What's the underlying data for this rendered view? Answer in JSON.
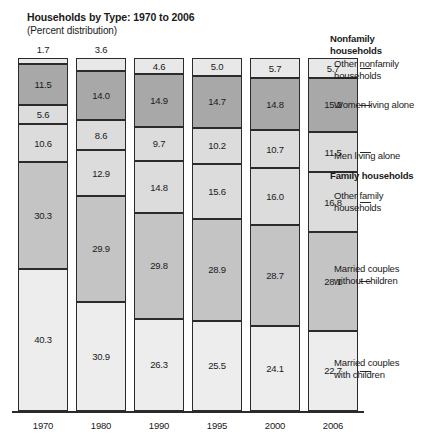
{
  "chart_data": {
    "type": "bar",
    "title": "Households by Type: 1970 to 2006",
    "subtitle": "(Percent distribution)",
    "xlabel": "",
    "ylabel": "",
    "ylim": [
      0,
      100
    ],
    "grid": false,
    "stacked": true,
    "legend_position": "right",
    "categories": [
      "1970",
      "1980",
      "1990",
      "1995",
      "2000",
      "2006"
    ],
    "series": [
      {
        "name": "Other nonfamily households",
        "group": "Nonfamily households",
        "color": "#e8e8e8",
        "values": [
          1.7,
          3.6,
          4.6,
          5.0,
          5.7,
          5.7
        ]
      },
      {
        "name": "Women living alone",
        "group": "Nonfamily households",
        "color": "#a8a8a8",
        "values": [
          11.5,
          14.0,
          14.9,
          14.7,
          14.8,
          15.2
        ]
      },
      {
        "name": "Men living alone",
        "group": "Nonfamily households",
        "color": "#dcdcdc",
        "values": [
          5.6,
          8.6,
          9.7,
          10.2,
          10.7,
          11.5
        ]
      },
      {
        "name": "Other family households",
        "group": "Family households",
        "color": "#dcdcdc",
        "values": [
          10.6,
          12.9,
          14.8,
          15.6,
          16.0,
          16.8
        ]
      },
      {
        "name": "Married couples without children",
        "group": "Family households",
        "color": "#c4c4c4",
        "values": [
          30.3,
          29.9,
          29.8,
          28.9,
          28.7,
          28.1
        ]
      },
      {
        "name": "Married couples with children",
        "group": "Family households",
        "color": "#ededed",
        "values": [
          40.3,
          30.9,
          26.3,
          25.5,
          24.1,
          22.7
        ]
      }
    ]
  },
  "legend": {
    "heading_nonfamily": "Nonfamily\nhouseholds",
    "heading_family": "Family households",
    "items": [
      {
        "label": "Other nonfamily\nhouseholds"
      },
      {
        "label": "Women living alone"
      },
      {
        "label": "Men living alone"
      },
      {
        "label": "Other family\nhouseholds"
      },
      {
        "label": "Married couples\nwithout children"
      },
      {
        "label": "Married couples\nwith children"
      }
    ]
  }
}
